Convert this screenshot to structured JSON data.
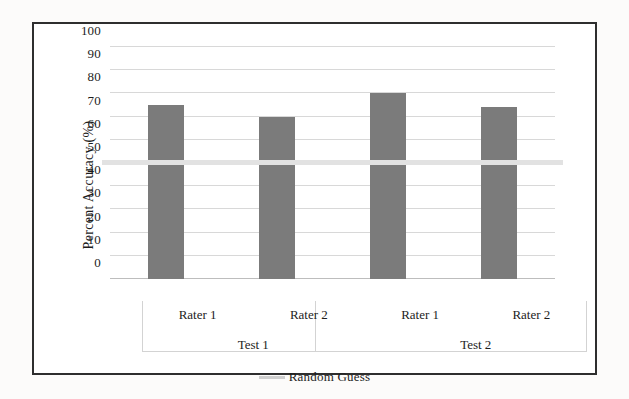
{
  "chart_data": {
    "type": "bar",
    "title": "",
    "xlabel": "",
    "ylabel": "Percent Accuracy (%)",
    "ylim": [
      0,
      100
    ],
    "ytick_labels": [
      "100",
      "90",
      "80",
      "70",
      "60",
      "50",
      "40",
      "30",
      "20",
      "10",
      "0"
    ],
    "ytick_values": [
      100,
      90,
      80,
      70,
      60,
      50,
      40,
      30,
      20,
      10,
      0
    ],
    "grid": true,
    "legend_position": "bottom-center",
    "categories": [
      "Rater 1",
      "Rater 2",
      "Rater 1",
      "Rater 2"
    ],
    "groups": [
      "Test 1",
      "Test 2"
    ],
    "values": [
      75,
      70,
      80,
      74
    ],
    "series": [
      {
        "name": "Percent Accuracy",
        "color": "#7b7b7b",
        "points": [
          {
            "group": "Test 1",
            "category": "Rater 1",
            "value": 75
          },
          {
            "group": "Test 1",
            "category": "Rater 2",
            "value": 70
          },
          {
            "group": "Test 2",
            "category": "Rater 1",
            "value": 80
          },
          {
            "group": "Test 2",
            "category": "Rater 2",
            "value": 74
          }
        ]
      }
    ],
    "reference_lines": [
      {
        "label": "Random Guess",
        "value": 50,
        "color": "#e2e2e2"
      }
    ],
    "legend": [
      {
        "label": "Random Guess",
        "marker": "line",
        "color": "#cfcfcf"
      }
    ]
  },
  "colors": {
    "bar": "#7b7b7b",
    "reference_line": "#e2e2e2",
    "legend_marker": "#cfcfcf",
    "grid": "#d8d8d8",
    "frame": "#2e2e2e",
    "text": "#1d1d1d",
    "background": "#ffffff"
  }
}
